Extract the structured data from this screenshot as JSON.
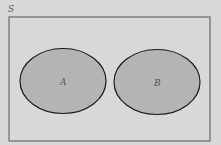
{
  "diagram": {
    "type": "venn",
    "universe": {
      "label": "S",
      "fill": "#d8d8d6",
      "stroke": "#666666"
    },
    "sets": [
      {
        "label": "A",
        "fill": "#b4b4b2",
        "stroke": "#1a1a1a",
        "overlap": false
      },
      {
        "label": "B",
        "fill": "#b4b4b2",
        "stroke": "#1a1a1a",
        "overlap": false
      }
    ]
  }
}
